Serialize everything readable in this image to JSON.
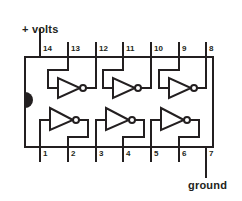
{
  "diagram": {
    "device": "hex inverter DIP-14 IC",
    "colors": {
      "line": "#231f20",
      "background": "#ffffff",
      "notch": "#231f20",
      "text": "#231f20"
    },
    "package": {
      "type": "DIP-14",
      "pin_count": 14,
      "notch": "semicircle-left-edge"
    },
    "power_label": "+ volts",
    "ground_label": "ground",
    "power_pin": "14",
    "ground_pin": "7",
    "top_pins": [
      {
        "number": "14",
        "x": 42
      },
      {
        "number": "13",
        "x": 70
      },
      {
        "number": "12",
        "x": 98
      },
      {
        "number": "11",
        "x": 125
      },
      {
        "number": "10",
        "x": 153
      },
      {
        "number": "9",
        "x": 181
      },
      {
        "number": "8",
        "x": 208
      }
    ],
    "bottom_pins": [
      {
        "number": "1",
        "x": 42
      },
      {
        "number": "2",
        "x": 70
      },
      {
        "number": "3",
        "x": 98
      },
      {
        "number": "4",
        "x": 125
      },
      {
        "number": "5",
        "x": 153
      },
      {
        "number": "6",
        "x": 181
      },
      {
        "number": "7",
        "x": 208
      }
    ],
    "gates": [
      {
        "name": "inverter-1",
        "row": "top",
        "input_pin": "13",
        "output_pin": "12"
      },
      {
        "name": "inverter-2",
        "row": "top",
        "input_pin": "11",
        "output_pin": "10"
      },
      {
        "name": "inverter-3",
        "row": "top",
        "input_pin": "9",
        "output_pin": "8"
      },
      {
        "name": "inverter-4",
        "row": "bottom",
        "input_pin": "1",
        "output_pin": "2"
      },
      {
        "name": "inverter-5",
        "row": "bottom",
        "input_pin": "3",
        "output_pin": "4"
      },
      {
        "name": "inverter-6",
        "row": "bottom",
        "input_pin": "5",
        "output_pin": "6"
      }
    ]
  }
}
